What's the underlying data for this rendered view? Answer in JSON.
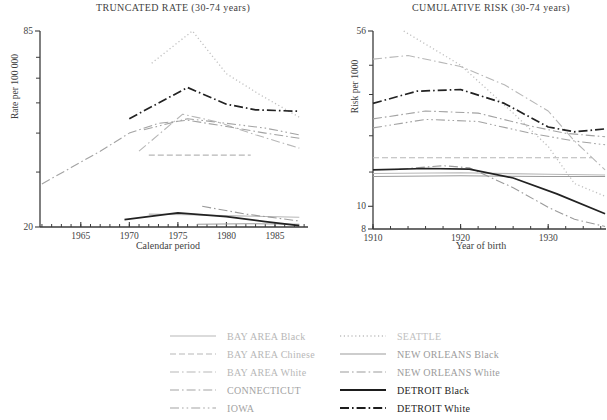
{
  "figure_title": "",
  "left_chart": {
    "title": "TRUNCATED RATE (30-74 years)",
    "ylabel": "Rate per 100 000",
    "xlabel": "Calendar period"
  },
  "right_chart": {
    "title": "CUMULATIVE RISK (30-74 years)",
    "ylabel": "Risk per 1000",
    "xlabel": "Year of birth"
  },
  "chart_data": [
    {
      "type": "line",
      "title": "TRUNCATED RATE (30-74 years)",
      "xlabel": "Calendar period",
      "ylabel": "Rate per 100 000",
      "yscale": "log",
      "xlim": [
        1960.8,
        1988.4
      ],
      "ylim": [
        20,
        85
      ],
      "xticks_labeled": [
        1965,
        1970,
        1975,
        1980,
        1985
      ],
      "xticks_minor": {
        "from": 1961,
        "to": 1988,
        "step": 1
      },
      "yticks_labeled": [
        85,
        20
      ],
      "yticks_minor": [
        70,
        60,
        50,
        40,
        30
      ],
      "grid": false,
      "series": [
        {
          "name": "BAY AREA Black",
          "dash": "solid",
          "color": "#b7b7b7",
          "width": 1.1,
          "x": [
            1972,
            1976,
            1981,
            1987.5
          ],
          "y": [
            22.0,
            21.9,
            21.7,
            21.5
          ]
        },
        {
          "name": "BAY AREA Chinese",
          "dash": "dashed",
          "color": "#b7b7b7",
          "width": 1.1,
          "x": [
            1972,
            1982.5
          ],
          "y": [
            34,
            34
          ]
        },
        {
          "name": "BAY AREA White",
          "dash": "dashdot",
          "color": "#b7b7b7",
          "width": 1.1,
          "x": [
            1971,
            1975.5,
            1979,
            1983,
            1987.5
          ],
          "y": [
            35,
            46,
            43.5,
            39.5,
            35.8
          ]
        },
        {
          "name": "CONNECTICUT",
          "dash": "dashdot",
          "color": "#a3a3a3",
          "width": 1.1,
          "x": [
            1961,
            1964,
            1967,
            1970,
            1973,
            1976,
            1980,
            1984,
            1987.5
          ],
          "y": [
            27.5,
            31,
            35,
            40,
            43,
            44,
            42,
            40,
            38.5
          ]
        },
        {
          "name": "IOWA",
          "dash": "dashdotdot",
          "color": "#a3a3a3",
          "width": 1.1,
          "x": [
            1971.5,
            1976,
            1980,
            1984,
            1987.5
          ],
          "y": [
            41,
            44.5,
            43,
            41.5,
            39.5
          ]
        },
        {
          "name": "SEATTLE",
          "dash": "dotted",
          "color": "#c0c0c0",
          "width": 1.3,
          "x": [
            1972.3,
            1976.5,
            1980,
            1983.5,
            1987.5
          ],
          "y": [
            67,
            85,
            62,
            53,
            45
          ]
        },
        {
          "name": "NEW ORLEANS Black",
          "dash": "solid",
          "color": "#9b9b9b",
          "width": 1.1,
          "x": [
            1977,
            1982,
            1987.5
          ],
          "y": [
            20.4,
            20.5,
            20.4
          ]
        },
        {
          "name": "NEW ORLEANS White",
          "dash": "dashdot",
          "color": "#9b9b9b",
          "width": 1.1,
          "x": [
            1977.5,
            1982,
            1987.5
          ],
          "y": [
            23.3,
            22,
            20.9
          ]
        },
        {
          "name": "DETROIT Black",
          "dash": "solid",
          "color": "#222222",
          "width": 1.7,
          "x": [
            1969.5,
            1975,
            1980,
            1984,
            1987.5
          ],
          "y": [
            21.1,
            22.2,
            21.6,
            20.8,
            20.2
          ]
        },
        {
          "name": "DETROIT White",
          "dash": "dashdot",
          "color": "#222222",
          "width": 1.7,
          "x": [
            1970,
            1976,
            1980,
            1983,
            1987.5
          ],
          "y": [
            44.5,
            56,
            49.5,
            47.5,
            47
          ]
        }
      ]
    },
    {
      "type": "line",
      "title": "CUMULATIVE RISK (30-74 years)",
      "xlabel": "Year of birth",
      "ylabel": "Risk per 1000",
      "yscale": "log",
      "xlim": [
        1910,
        1936.6
      ],
      "ylim": [
        8,
        56
      ],
      "xticks_labeled": [
        1910,
        1920,
        1930
      ],
      "xticks_minor": {
        "from": 1910,
        "to": 1936,
        "step": 2
      },
      "yticks_labeled": [
        56,
        10,
        8
      ],
      "yticks_minor": [
        40,
        30,
        20,
        14
      ],
      "grid": false,
      "series": [
        {
          "name": "BAY AREA Black",
          "dash": "solid",
          "color": "#b7b7b7",
          "width": 1.1,
          "x": [
            1910,
            1920,
            1930,
            1936.5
          ],
          "y": [
            13.8,
            13.9,
            13.7,
            13.6
          ]
        },
        {
          "name": "BAY AREA Chinese",
          "dash": "dashed",
          "color": "#b7b7b7",
          "width": 1.1,
          "x": [
            1910,
            1935
          ],
          "y": [
            16.1,
            16.1
          ]
        },
        {
          "name": "BAY AREA White",
          "dash": "dashdot",
          "color": "#b7b7b7",
          "width": 1.1,
          "x": [
            1910,
            1914,
            1920,
            1925,
            1930,
            1933,
            1936.5
          ],
          "y": [
            42.5,
            44,
            39.5,
            33,
            25.5,
            19,
            14.3
          ]
        },
        {
          "name": "CONNECTICUT",
          "dash": "dashdot",
          "color": "#a3a3a3",
          "width": 1.1,
          "x": [
            1910,
            1916,
            1922,
            1928,
            1932,
            1936.5
          ],
          "y": [
            23.6,
            25.5,
            25,
            22,
            20.5,
            19.8
          ]
        },
        {
          "name": "IOWA",
          "dash": "dashdotdot",
          "color": "#a3a3a3",
          "width": 1.1,
          "x": [
            1910,
            1916,
            1922,
            1928,
            1933,
            1936.5
          ],
          "y": [
            21.6,
            23.5,
            23,
            20.5,
            19,
            18.3
          ]
        },
        {
          "name": "SEATTLE",
          "dash": "dotted",
          "color": "#c0c0c0",
          "width": 1.3,
          "x": [
            1913.5,
            1920,
            1926,
            1930,
            1933,
            1936.6
          ],
          "y": [
            56,
            40,
            25,
            18,
            12.5,
            11
          ]
        },
        {
          "name": "NEW ORLEANS Black",
          "dash": "solid",
          "color": "#9b9b9b",
          "width": 1.1,
          "x": [
            1910,
            1920,
            1930,
            1936.5
          ],
          "y": [
            13.4,
            13.5,
            13.4,
            13.4
          ]
        },
        {
          "name": "NEW ORLEANS White",
          "dash": "dashdot",
          "color": "#9b9b9b",
          "width": 1.1,
          "x": [
            1913,
            1918,
            1921,
            1926,
            1930,
            1933,
            1936.5
          ],
          "y": [
            14.4,
            14.9,
            14.6,
            12,
            9.9,
            8.8,
            8.2
          ]
        },
        {
          "name": "DETROIT Black",
          "dash": "solid",
          "color": "#222222",
          "width": 1.7,
          "x": [
            1910,
            1916,
            1921,
            1926,
            1931,
            1936.5
          ],
          "y": [
            14.3,
            14.5,
            14.4,
            13.2,
            11.3,
            9.3
          ]
        },
        {
          "name": "DETROIT White",
          "dash": "dashdot",
          "color": "#222222",
          "width": 1.7,
          "x": [
            1910,
            1915,
            1920,
            1925,
            1930,
            1933,
            1936.5
          ],
          "y": [
            27.5,
            31,
            31.5,
            27.5,
            21.8,
            20.8,
            21.4
          ]
        }
      ]
    }
  ],
  "legend": {
    "columns": [
      {
        "items": [
          {
            "label": "BAY AREA Black",
            "dash": "solid",
            "color": "#b7b7b7",
            "width": 1.2
          },
          {
            "label": "BAY AREA Chinese",
            "dash": "dashed",
            "color": "#b7b7b7",
            "width": 1.2
          },
          {
            "label": "BAY AREA White",
            "dash": "dashdot",
            "color": "#b7b7b7",
            "width": 1.2
          },
          {
            "label": "CONNECTICUT",
            "dash": "dashdot",
            "color": "#a3a3a3",
            "width": 1.2
          },
          {
            "label": "IOWA",
            "dash": "dashdotdot",
            "color": "#a3a3a3",
            "width": 1.2
          }
        ]
      },
      {
        "items": [
          {
            "label": "SEATTLE",
            "dash": "dotted",
            "color": "#c0c0c0",
            "width": 1.3
          },
          {
            "label": "NEW ORLEANS Black",
            "dash": "solid",
            "color": "#9b9b9b",
            "width": 1.2
          },
          {
            "label": "NEW ORLEANS White",
            "dash": "dashdot",
            "color": "#9b9b9b",
            "width": 1.2
          },
          {
            "label": "DETROIT Black",
            "dash": "solid",
            "color": "#1d1d1d",
            "width": 2.0
          },
          {
            "label": "DETROIT White",
            "dash": "dashdot",
            "color": "#1d1d1d",
            "width": 2.0
          }
        ]
      }
    ]
  }
}
